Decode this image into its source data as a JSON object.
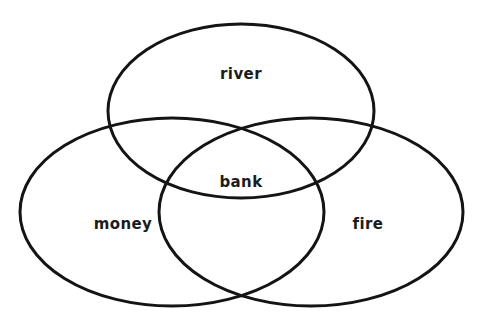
{
  "figure": {
    "type": "venn-diagram",
    "title": "",
    "background_color": "#ffffff",
    "stroke_color": "#141414",
    "text_color": "#1c1c1c",
    "width": 482,
    "height": 330
  },
  "chart_data": {
    "type": "venn",
    "title": "",
    "sets": [
      {
        "name": "river",
        "label": "river",
        "label_x": 241,
        "label_y": 74,
        "cx": 241,
        "cy": 111,
        "rx": 133,
        "ry": 87,
        "stroke_width": 3
      },
      {
        "name": "money",
        "label": "money",
        "label_x": 123,
        "label_y": 224,
        "cx": 172,
        "cy": 212,
        "rx": 152,
        "ry": 94,
        "stroke_width": 3
      },
      {
        "name": "fire",
        "label": "fire",
        "label_x": 368,
        "label_y": 224,
        "cx": 311,
        "cy": 212,
        "rx": 152,
        "ry": 94,
        "stroke_width": 3
      }
    ],
    "intersections": [
      {
        "name": "all-three",
        "label": "bank",
        "members": [
          "river",
          "money",
          "fire"
        ],
        "label_x": 241,
        "label_y": 182
      }
    ],
    "legend": "none",
    "grid": false
  },
  "labels": {
    "river": "river",
    "money": "money",
    "fire": "fire",
    "bank": "bank"
  },
  "font": {
    "label_size": 15,
    "center_label_size": 15
  }
}
